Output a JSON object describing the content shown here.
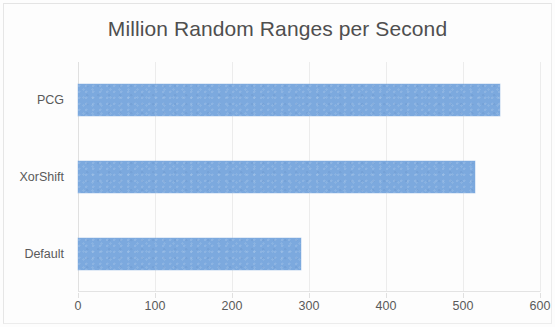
{
  "chart_data": {
    "type": "bar",
    "orientation": "horizontal",
    "title": "Million Random Ranges per Second",
    "xlabel": "",
    "ylabel": "",
    "categories": [
      "PCG",
      "XorShift",
      "Default"
    ],
    "values": [
      548,
      516,
      289
    ],
    "series": [
      {
        "name": "Million Random Ranges per Second",
        "values": [
          548,
          516,
          289
        ]
      }
    ],
    "xlim": [
      0,
      600
    ],
    "xticks": [
      0,
      100,
      200,
      300,
      400,
      500,
      600
    ],
    "xtick_labels": [
      "0",
      "100",
      "200",
      "300",
      "400",
      "500",
      "600"
    ],
    "grid": true,
    "grid_axis": "x",
    "legend": false,
    "legend_position": "none",
    "bar_color": "#7ca9de",
    "text_color": "#595959",
    "gridline_color": "#ececec",
    "background_color": "#fdfdfd"
  }
}
